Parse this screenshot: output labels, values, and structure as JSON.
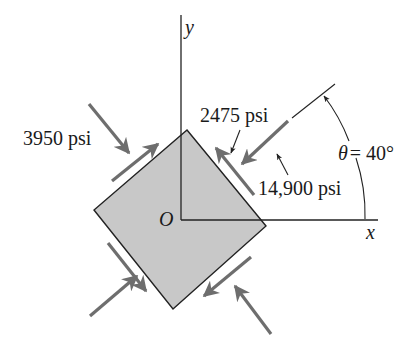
{
  "figure": {
    "type": "plane-stress-element",
    "axes": {
      "x_label": "x",
      "y_label": "y",
      "origin_label": "O"
    },
    "rotation": {
      "label": "θ = 40°",
      "symbol": "θ",
      "value_text": "= 40°",
      "angle_deg": 40
    },
    "stresses": {
      "normal_1": "14,900 psi",
      "normal_2": "3950 psi",
      "shear": "2475 psi"
    }
  },
  "colors": {
    "element_fill": "#c8c8c8",
    "element_stroke": "#222222",
    "arrow": "#6e6e6e",
    "axis": "#222222",
    "text": "#1a1a1a"
  }
}
